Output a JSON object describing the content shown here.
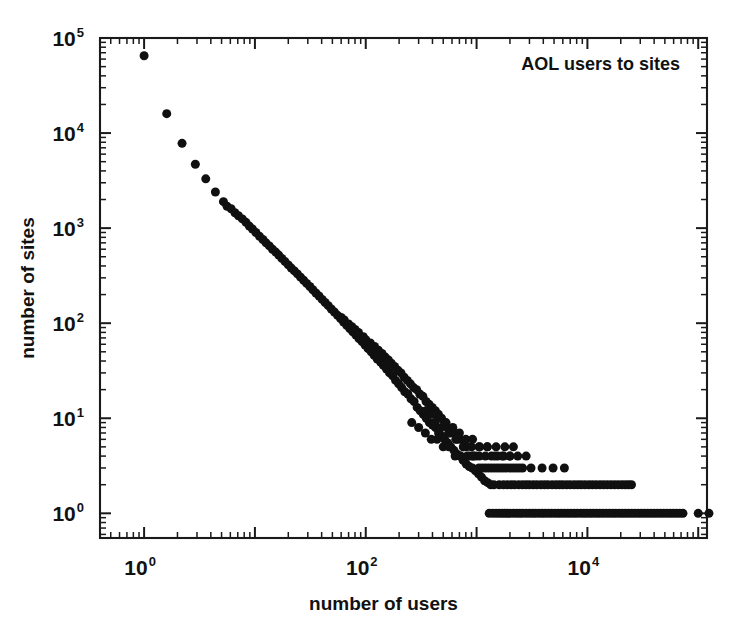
{
  "chart_data": {
    "type": "scatter",
    "title": "",
    "annotation": "AOL users to sites",
    "xlabel": "number of users",
    "ylabel": "number of sites",
    "xscale": "log",
    "yscale": "log",
    "xlim": [
      0.4,
      120000
    ],
    "ylim": [
      0.55,
      100000
    ],
    "xticks": [
      1,
      100,
      10000
    ],
    "xtick_labels": [
      "10",
      "10",
      "10"
    ],
    "xtick_exponents": [
      "0",
      "2",
      "4"
    ],
    "yticks": [
      1,
      10,
      100,
      1000,
      10000,
      100000
    ],
    "ytick_labels": [
      "10",
      "10",
      "10",
      "10",
      "10",
      "10"
    ],
    "ytick_exponents": [
      "0",
      "1",
      "2",
      "3",
      "4",
      "5"
    ],
    "grid": false,
    "legend": "none",
    "marker": "filled-circle",
    "marker_color": "#101010",
    "marker_size_px": 9,
    "points": [
      [
        1,
        65000
      ],
      [
        1.6,
        16000
      ],
      [
        2.2,
        7800
      ],
      [
        2.9,
        4700
      ],
      [
        3.6,
        3300
      ],
      [
        4.4,
        2400
      ],
      [
        5.2,
        1900
      ],
      [
        5.6,
        1700
      ],
      [
        6.1,
        1600
      ],
      [
        6.6,
        1450
      ],
      [
        7.1,
        1350
      ],
      [
        7.7,
        1250
      ],
      [
        8.3,
        1150
      ],
      [
        8.9,
        1050
      ],
      [
        9.5,
        980
      ],
      [
        10.2,
        900
      ],
      [
        11,
        820
      ],
      [
        11.8,
        760
      ],
      [
        12.6,
        700
      ],
      [
        13.5,
        650
      ],
      [
        14.4,
        600
      ],
      [
        15.4,
        560
      ],
      [
        16.4,
        520
      ],
      [
        17.5,
        480
      ],
      [
        18.7,
        445
      ],
      [
        20,
        410
      ],
      [
        21.3,
        380
      ],
      [
        22.7,
        355
      ],
      [
        24.2,
        330
      ],
      [
        25.8,
        305
      ],
      [
        27.5,
        283
      ],
      [
        29.3,
        262
      ],
      [
        31.3,
        243
      ],
      [
        33.3,
        225
      ],
      [
        35.5,
        208
      ],
      [
        37.9,
        193
      ],
      [
        40.4,
        178
      ],
      [
        43,
        165
      ],
      [
        45.9,
        153
      ],
      [
        48.9,
        141
      ],
      [
        52.1,
        131
      ],
      [
        55.6,
        121
      ],
      [
        59.2,
        112
      ],
      [
        63.1,
        103
      ],
      [
        67.3,
        95
      ],
      [
        71.7,
        88
      ],
      [
        76.4,
        81
      ],
      [
        81.5,
        75
      ],
      [
        86.8,
        69
      ],
      [
        92.5,
        64
      ],
      [
        98.6,
        59
      ],
      [
        105,
        54
      ],
      [
        112,
        50
      ],
      [
        119,
        46
      ],
      [
        127,
        42
      ],
      [
        136,
        39
      ],
      [
        144,
        36
      ],
      [
        154,
        33
      ],
      [
        164,
        30
      ],
      [
        175,
        28
      ],
      [
        186,
        25
      ],
      [
        198,
        23
      ],
      [
        211,
        21
      ],
      [
        225,
        19
      ],
      [
        240,
        18
      ],
      [
        256,
        16
      ],
      [
        273,
        15
      ],
      [
        291,
        13
      ],
      [
        310,
        12
      ],
      [
        330,
        11
      ],
      [
        352,
        10
      ],
      [
        375,
        9
      ],
      [
        400,
        8.5
      ],
      [
        426,
        8
      ],
      [
        454,
        7
      ],
      [
        484,
        6.5
      ],
      [
        516,
        6
      ],
      [
        550,
        5.5
      ],
      [
        586,
        5
      ],
      [
        625,
        4.6
      ],
      [
        666,
        4.2
      ],
      [
        710,
        4
      ],
      [
        757,
        3.6
      ],
      [
        806,
        3.3
      ],
      [
        859,
        3.1
      ],
      [
        916,
        3
      ],
      [
        976,
        2.8
      ],
      [
        1040,
        2.6
      ],
      [
        1109,
        2.4
      ],
      [
        1182,
        2.2
      ],
      [
        1260,
        2.1
      ],
      [
        1343,
        2
      ],
      [
        1431,
        2
      ],
      [
        60,
        115
      ],
      [
        64,
        108
      ],
      [
        70,
        98
      ],
      [
        75,
        92
      ],
      [
        80,
        86
      ],
      [
        86,
        80
      ],
      [
        95,
        72
      ],
      [
        100,
        67
      ],
      [
        110,
        62
      ],
      [
        120,
        57
      ],
      [
        130,
        52
      ],
      [
        140,
        48
      ],
      [
        150,
        44
      ],
      [
        160,
        41
      ],
      [
        170,
        38
      ],
      [
        182,
        35
      ],
      [
        195,
        32
      ],
      [
        208,
        30
      ],
      [
        222,
        27
      ],
      [
        237,
        25
      ],
      [
        253,
        23
      ],
      [
        270,
        21
      ],
      [
        288,
        20
      ],
      [
        307,
        18
      ],
      [
        328,
        17
      ],
      [
        350,
        15
      ],
      [
        373,
        14
      ],
      [
        398,
        13
      ],
      [
        425,
        12
      ],
      [
        453,
        11
      ],
      [
        483,
        10
      ],
      [
        516,
        9
      ],
      [
        550,
        8
      ],
      [
        587,
        7
      ],
      [
        626,
        7
      ],
      [
        668,
        6
      ],
      [
        713,
        6
      ],
      [
        760,
        5
      ],
      [
        811,
        5
      ],
      [
        865,
        4
      ],
      [
        923,
        4
      ],
      [
        985,
        4
      ],
      [
        1050,
        3
      ],
      [
        1121,
        3
      ],
      [
        1196,
        3
      ],
      [
        1276,
        3
      ],
      [
        1361,
        3
      ],
      [
        1452,
        3
      ],
      [
        1549,
        3
      ],
      [
        1653,
        3
      ],
      [
        1763,
        3
      ],
      [
        1881,
        3
      ],
      [
        2007,
        3
      ],
      [
        2141,
        3
      ],
      [
        2284,
        3
      ],
      [
        2437,
        3
      ],
      [
        2600,
        3
      ],
      [
        3100,
        3
      ],
      [
        3900,
        3
      ],
      [
        4900,
        3
      ],
      [
        6200,
        3
      ],
      [
        260,
        9
      ],
      [
        300,
        8
      ],
      [
        345,
        7
      ],
      [
        390,
        6
      ],
      [
        440,
        6
      ],
      [
        500,
        5
      ],
      [
        560,
        5
      ],
      [
        640,
        4
      ],
      [
        720,
        4
      ],
      [
        820,
        4
      ],
      [
        930,
        4
      ],
      [
        1060,
        4
      ],
      [
        1200,
        4
      ],
      [
        1360,
        4
      ],
      [
        1550,
        4
      ],
      [
        1760,
        4
      ],
      [
        2000,
        4
      ],
      [
        420,
        9
      ],
      [
        480,
        8
      ],
      [
        560,
        7
      ],
      [
        650,
        6
      ],
      [
        760,
        5
      ],
      [
        900,
        5
      ],
      [
        1050,
        5
      ],
      [
        1250,
        5
      ],
      [
        1500,
        5
      ],
      [
        1800,
        5
      ],
      [
        2150,
        5
      ],
      [
        350,
        12
      ],
      [
        400,
        11
      ],
      [
        460,
        10
      ],
      [
        530,
        9
      ],
      [
        610,
        8
      ],
      [
        700,
        7
      ],
      [
        800,
        6
      ],
      [
        920,
        6
      ],
      [
        1070,
        5
      ],
      [
        1250,
        5
      ],
      [
        1460,
        4
      ],
      [
        1700,
        4
      ],
      [
        2000,
        4
      ],
      [
        2350,
        4
      ],
      [
        2800,
        4
      ],
      [
        1600,
        2
      ],
      [
        1750,
        2
      ],
      [
        1900,
        2
      ],
      [
        2050,
        2
      ],
      [
        2200,
        2
      ],
      [
        2400,
        2
      ],
      [
        2600,
        2
      ],
      [
        2800,
        2
      ],
      [
        3000,
        2
      ],
      [
        3250,
        2
      ],
      [
        3500,
        2
      ],
      [
        3800,
        2
      ],
      [
        4100,
        2
      ],
      [
        4400,
        2
      ],
      [
        4800,
        2
      ],
      [
        5200,
        2
      ],
      [
        5600,
        2
      ],
      [
        6000,
        2
      ],
      [
        6500,
        2
      ],
      [
        7000,
        2
      ],
      [
        7600,
        2
      ],
      [
        8200,
        2
      ],
      [
        8800,
        2
      ],
      [
        9500,
        2
      ],
      [
        10300,
        2
      ],
      [
        11100,
        2
      ],
      [
        12000,
        2
      ],
      [
        13000,
        2
      ],
      [
        14000,
        2
      ],
      [
        15100,
        2
      ],
      [
        16300,
        2
      ],
      [
        17600,
        2
      ],
      [
        19000,
        2
      ],
      [
        20500,
        2
      ],
      [
        22000,
        2
      ],
      [
        23500,
        2
      ],
      [
        25000,
        2
      ],
      [
        1300,
        1
      ],
      [
        1400,
        1
      ],
      [
        1500,
        1
      ],
      [
        1600,
        1
      ],
      [
        1700,
        1
      ],
      [
        1800,
        1
      ],
      [
        1900,
        1
      ],
      [
        2000,
        1
      ],
      [
        2150,
        1
      ],
      [
        2300,
        1
      ],
      [
        2450,
        1
      ],
      [
        2600,
        1
      ],
      [
        2800,
        1
      ],
      [
        3000,
        1
      ],
      [
        3200,
        1
      ],
      [
        3400,
        1
      ],
      [
        3650,
        1
      ],
      [
        3900,
        1
      ],
      [
        4150,
        1
      ],
      [
        4450,
        1
      ],
      [
        4750,
        1
      ],
      [
        5100,
        1
      ],
      [
        5450,
        1
      ],
      [
        5800,
        1
      ],
      [
        6200,
        1
      ],
      [
        6650,
        1
      ],
      [
        7100,
        1
      ],
      [
        7600,
        1
      ],
      [
        8100,
        1
      ],
      [
        8700,
        1
      ],
      [
        9300,
        1
      ],
      [
        9900,
        1
      ],
      [
        10600,
        1
      ],
      [
        11300,
        1
      ],
      [
        12100,
        1
      ],
      [
        12900,
        1
      ],
      [
        13800,
        1
      ],
      [
        14800,
        1
      ],
      [
        15800,
        1
      ],
      [
        16900,
        1
      ],
      [
        18000,
        1
      ],
      [
        19300,
        1
      ],
      [
        20600,
        1
      ],
      [
        22000,
        1
      ],
      [
        23500,
        1
      ],
      [
        25100,
        1
      ],
      [
        26800,
        1
      ],
      [
        28700,
        1
      ],
      [
        30600,
        1
      ],
      [
        32700,
        1
      ],
      [
        35000,
        1
      ],
      [
        37400,
        1
      ],
      [
        40000,
        1
      ],
      [
        42700,
        1
      ],
      [
        45700,
        1
      ],
      [
        48800,
        1
      ],
      [
        52200,
        1
      ],
      [
        55800,
        1
      ],
      [
        59600,
        1
      ],
      [
        63700,
        1
      ],
      [
        68100,
        1
      ],
      [
        72800,
        1
      ],
      [
        100000,
        1
      ],
      [
        125000,
        1
      ],
      [
        155000,
        1
      ],
      [
        165000,
        1
      ],
      [
        330000,
        1
      ]
    ]
  }
}
